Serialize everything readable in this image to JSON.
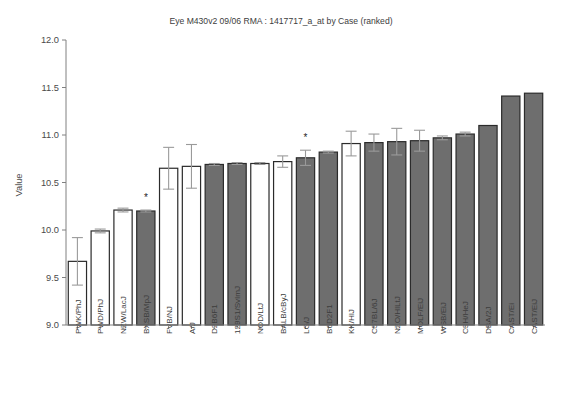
{
  "chart_data": {
    "type": "bar",
    "title": "Eye M430v2 09/06 RMA : 1417717_a_at by Case (ranked)",
    "xlabel": "",
    "ylabel": "Value",
    "ylim": [
      9.0,
      12.0
    ],
    "ytick_labels": [
      "9.0",
      "9.5",
      "10.0",
      "10.5",
      "11.0",
      "11.5",
      "12.0"
    ],
    "ytick_values": [
      9.0,
      9.5,
      10.0,
      10.5,
      11.0,
      11.5,
      12.0
    ],
    "grid": false,
    "legend": "none",
    "categories": [
      "PWK/PhJ",
      "PWD/PhJ",
      "NZW/LacJ",
      "BXSB/MpJ",
      "FVB/NJ",
      "A/J",
      "D2B6F1",
      "129S1/SvImJ",
      "NOD/LtJ",
      "BALB/cByJ",
      "LG/J",
      "B6D2F1",
      "KK/HlJ",
      "C57BL/6J",
      "NZO/HlLtJ",
      "MOLF/EiJ",
      "WSB/EiJ",
      "C3H/HeJ",
      "DBA/2J",
      "CAST/Ei",
      "CAST/EiJ"
    ],
    "values": [
      9.67,
      9.99,
      10.21,
      10.2,
      10.65,
      10.67,
      10.69,
      10.7,
      10.7,
      10.72,
      10.76,
      10.82,
      10.91,
      10.92,
      10.93,
      10.94,
      10.97,
      11.01,
      11.1,
      11.41,
      11.44
    ],
    "errors_low": [
      0.25,
      0.02,
      0.02,
      0.01,
      0.22,
      0.23,
      0.01,
      0.01,
      0.01,
      0.06,
      0.08,
      0.01,
      0.13,
      0.09,
      0.14,
      0.11,
      0.02,
      0.02,
      0.0,
      0.0,
      0.0
    ],
    "errors_high": [
      0.25,
      0.02,
      0.02,
      0.01,
      0.22,
      0.23,
      0.01,
      0.01,
      0.01,
      0.06,
      0.08,
      0.01,
      0.13,
      0.09,
      0.14,
      0.11,
      0.02,
      0.02,
      0.0,
      0.0,
      0.0
    ],
    "bar_fill_styles": [
      "open",
      "open",
      "open",
      "filled",
      "open",
      "open",
      "filled",
      "filled",
      "open",
      "open",
      "filled",
      "filled",
      "open",
      "filled",
      "filled",
      "filled",
      "filled",
      "filled",
      "filled",
      "filled",
      "filled"
    ],
    "significance_markers": [
      {
        "category": "BXSB/MpJ",
        "index": 3,
        "symbol": "*"
      },
      {
        "category": "LG/J",
        "index": 10,
        "symbol": "*"
      }
    ],
    "colors": {
      "bar_fill": "#6e6e6e",
      "bar_open_fill": "#ffffff",
      "bar_stroke": "#2b2b2b",
      "error_bar": "#9a9a9a",
      "axis": "#808080",
      "text": "#3d3d3d",
      "background": "#ffffff"
    }
  }
}
